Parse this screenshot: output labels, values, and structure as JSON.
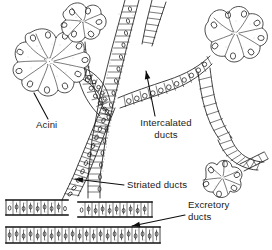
{
  "figure": {
    "type": "histology-line-diagram",
    "background_color": "#ffffff",
    "ink_color": "#111111",
    "label_color": "#1a1a1a"
  },
  "labels": [
    {
      "id": "acini",
      "line1": "Acini",
      "line2": "",
      "x": 36,
      "y": 128,
      "anchor": "start",
      "leader": {
        "from_x": 48,
        "from_y": 119,
        "to_x": 34,
        "to_y": 93,
        "has_arrowhead": false
      }
    },
    {
      "id": "intercalated-ducts",
      "line1": "Intercalated",
      "line2": "ducts",
      "x": 166,
      "y": 126,
      "anchor": "middle",
      "leader": {
        "from_x": 155,
        "from_y": 116,
        "to_x": 146,
        "to_y": 71,
        "has_arrowhead": true
      }
    },
    {
      "id": "striated-ducts",
      "line1": "Striated ducts",
      "line2": "",
      "x": 127,
      "y": 188,
      "anchor": "start",
      "leader": {
        "from_x": 124,
        "from_y": 185,
        "to_x": 75,
        "to_y": 179,
        "has_arrowhead": true
      }
    },
    {
      "id": "excretory-ducts",
      "line1": "Excretory",
      "line2": "ducts",
      "x": 188,
      "y": 208,
      "anchor": "start",
      "leader": {
        "from_x": 185,
        "from_y": 215,
        "to_x": 132,
        "to_y": 226,
        "has_arrowhead": true
      }
    }
  ],
  "structures": {
    "acini": {
      "name": "Acini",
      "description": "Grape-like clusters of pyramidal secretory cells with round nuclei",
      "count": 3,
      "clusters": [
        {
          "id": "acinus-left",
          "cx": 38,
          "cy": 62
        },
        {
          "id": "acinus-top-center",
          "cx": 80,
          "cy": 26
        },
        {
          "id": "acinus-right",
          "cx": 228,
          "cy": 36
        }
      ]
    },
    "intercalated_ducts": {
      "name": "Intercalated ducts",
      "description": "Narrow ducts of low cuboidal epithelium connecting acini to striated ducts"
    },
    "striated_ducts": {
      "name": "Striated ducts",
      "description": "Wide ducts lined by columnar cells with basal striations"
    },
    "excretory_ducts": {
      "name": "Excretory ducts",
      "description": "Large horizontal ducts with pseudostratified columnar epithelium",
      "count": 2
    }
  }
}
